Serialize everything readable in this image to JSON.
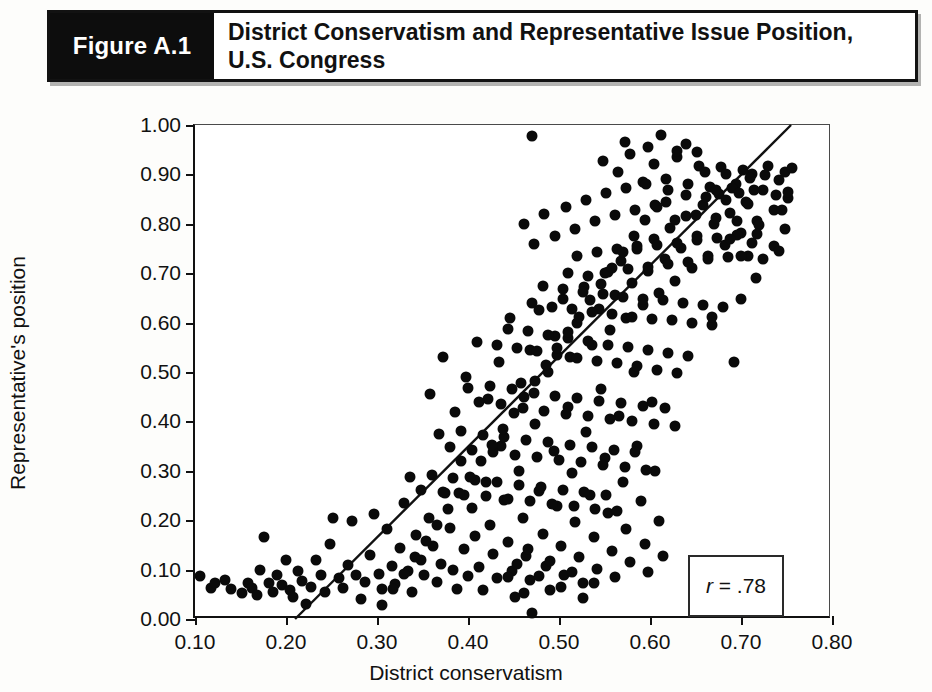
{
  "figure": {
    "number_label": "Figure A.1",
    "caption_line1": "District Conservatism and Representative Issue Position,",
    "caption_line2": "U.S. Congress"
  },
  "colors": {
    "point": "#0a0a0a",
    "axis": "#111111",
    "caption_bar_bg": "#0d0d0d",
    "caption_text": "#111111",
    "background": "#ffffff"
  },
  "annotation": {
    "symbol": "r",
    "equals": " = .78",
    "full": "r = .78"
  },
  "chart_data": {
    "type": "scatter",
    "title": "District Conservatism and Representative Issue Position, U.S. Congress",
    "xlabel": "District conservatism",
    "ylabel": "Representative's position",
    "xlim": [
      0.1,
      0.8
    ],
    "ylim": [
      0.0,
      1.0
    ],
    "xticks": [
      0.1,
      0.2,
      0.3,
      0.4,
      0.5,
      0.6,
      0.7,
      0.8
    ],
    "xtick_labels": [
      "0.10",
      "0.20",
      "0.30",
      "0.40",
      "0.50",
      "0.60",
      "0.70",
      "0.80"
    ],
    "yticks": [
      0.0,
      0.1,
      0.2,
      0.3,
      0.4,
      0.5,
      0.6,
      0.7,
      0.8,
      0.9,
      1.0
    ],
    "ytick_labels": [
      "0.00",
      "0.10",
      "0.20",
      "0.30",
      "0.40",
      "0.50",
      "0.60",
      "0.70",
      "0.80",
      "0.90",
      "1.00"
    ],
    "grid": false,
    "legend": false,
    "correlation": 0.78,
    "annotations": [
      "r = .78"
    ],
    "trendline": {
      "type": "linear",
      "x": [
        0.21,
        0.755
      ],
      "y": [
        0.0,
        1.0
      ]
    },
    "n_points": 380,
    "points": [
      [
        0.105,
        0.088
      ],
      [
        0.118,
        0.063
      ],
      [
        0.122,
        0.072
      ],
      [
        0.133,
        0.078
      ],
      [
        0.14,
        0.06
      ],
      [
        0.152,
        0.052
      ],
      [
        0.158,
        0.072
      ],
      [
        0.163,
        0.062
      ],
      [
        0.168,
        0.048
      ],
      [
        0.171,
        0.1
      ],
      [
        0.176,
        0.165
      ],
      [
        0.181,
        0.073
      ],
      [
        0.186,
        0.055
      ],
      [
        0.19,
        0.09
      ],
      [
        0.196,
        0.068
      ],
      [
        0.2,
        0.12
      ],
      [
        0.204,
        0.058
      ],
      [
        0.208,
        0.045
      ],
      [
        0.213,
        0.098
      ],
      [
        0.218,
        0.076
      ],
      [
        0.222,
        0.03
      ],
      [
        0.228,
        0.064
      ],
      [
        0.233,
        0.12
      ],
      [
        0.238,
        0.09
      ],
      [
        0.243,
        0.055
      ],
      [
        0.248,
        0.152
      ],
      [
        0.252,
        0.205
      ],
      [
        0.258,
        0.083
      ],
      [
        0.263,
        0.062
      ],
      [
        0.268,
        0.11
      ],
      [
        0.272,
        0.198
      ],
      [
        0.277,
        0.09
      ],
      [
        0.282,
        0.04
      ],
      [
        0.287,
        0.075
      ],
      [
        0.292,
        0.13
      ],
      [
        0.297,
        0.212
      ],
      [
        0.302,
        0.092
      ],
      [
        0.306,
        0.06
      ],
      [
        0.311,
        0.182
      ],
      [
        0.316,
        0.108
      ],
      [
        0.32,
        0.07
      ],
      [
        0.325,
        0.143
      ],
      [
        0.33,
        0.235
      ],
      [
        0.334,
        0.098
      ],
      [
        0.338,
        0.055
      ],
      [
        0.343,
        0.17
      ],
      [
        0.348,
        0.12
      ],
      [
        0.352,
        0.09
      ],
      [
        0.357,
        0.205
      ],
      [
        0.362,
        0.148
      ],
      [
        0.366,
        0.075
      ],
      [
        0.37,
        0.112
      ],
      [
        0.375,
        0.255
      ],
      [
        0.38,
        0.185
      ],
      [
        0.384,
        0.1
      ],
      [
        0.388,
        0.06
      ],
      [
        0.392,
        0.32
      ],
      [
        0.396,
        0.142
      ],
      [
        0.4,
        0.088
      ],
      [
        0.404,
        0.225
      ],
      [
        0.408,
        0.168
      ],
      [
        0.412,
        0.105
      ],
      [
        0.416,
        0.058
      ],
      [
        0.42,
        0.278
      ],
      [
        0.424,
        0.19
      ],
      [
        0.428,
        0.132
      ],
      [
        0.432,
        0.082
      ],
      [
        0.436,
        0.35
      ],
      [
        0.44,
        0.24
      ],
      [
        0.444,
        0.155
      ],
      [
        0.448,
        0.098
      ],
      [
        0.452,
        0.045
      ],
      [
        0.456,
        0.3
      ],
      [
        0.46,
        0.205
      ],
      [
        0.464,
        0.128
      ],
      [
        0.468,
        0.078
      ],
      [
        0.47,
        0.012
      ],
      [
        0.474,
        0.395
      ],
      [
        0.478,
        0.26
      ],
      [
        0.482,
        0.172
      ],
      [
        0.486,
        0.108
      ],
      [
        0.49,
        0.058
      ],
      [
        0.494,
        0.34
      ],
      [
        0.498,
        0.228
      ],
      [
        0.502,
        0.148
      ],
      [
        0.506,
        0.09
      ],
      [
        0.51,
        0.43
      ],
      [
        0.514,
        0.295
      ],
      [
        0.518,
        0.196
      ],
      [
        0.522,
        0.125
      ],
      [
        0.526,
        0.072
      ],
      [
        0.53,
        0.378
      ],
      [
        0.534,
        0.252
      ],
      [
        0.538,
        0.165
      ],
      [
        0.542,
        0.102
      ],
      [
        0.546,
        0.465
      ],
      [
        0.55,
        0.325
      ],
      [
        0.554,
        0.215
      ],
      [
        0.558,
        0.138
      ],
      [
        0.562,
        0.085
      ],
      [
        0.566,
        0.41
      ],
      [
        0.57,
        0.278
      ],
      [
        0.574,
        0.182
      ],
      [
        0.578,
        0.115
      ],
      [
        0.582,
        0.5
      ],
      [
        0.586,
        0.35
      ],
      [
        0.59,
        0.238
      ],
      [
        0.594,
        0.152
      ],
      [
        0.598,
        0.095
      ],
      [
        0.602,
        0.44
      ],
      [
        0.606,
        0.3
      ],
      [
        0.61,
        0.198
      ],
      [
        0.614,
        0.128
      ],
      [
        0.358,
        0.455
      ],
      [
        0.372,
        0.53
      ],
      [
        0.386,
        0.42
      ],
      [
        0.398,
        0.49
      ],
      [
        0.41,
        0.56
      ],
      [
        0.422,
        0.445
      ],
      [
        0.434,
        0.52
      ],
      [
        0.446,
        0.61
      ],
      [
        0.458,
        0.478
      ],
      [
        0.468,
        0.545
      ],
      [
        0.478,
        0.625
      ],
      [
        0.488,
        0.5
      ],
      [
        0.496,
        0.572
      ],
      [
        0.504,
        0.648
      ],
      [
        0.512,
        0.53
      ],
      [
        0.52,
        0.6
      ],
      [
        0.528,
        0.672
      ],
      [
        0.536,
        0.555
      ],
      [
        0.544,
        0.628
      ],
      [
        0.55,
        0.7
      ],
      [
        0.556,
        0.585
      ],
      [
        0.562,
        0.655
      ],
      [
        0.568,
        0.725
      ],
      [
        0.574,
        0.61
      ],
      [
        0.58,
        0.68
      ],
      [
        0.586,
        0.748
      ],
      [
        0.592,
        0.635
      ],
      [
        0.598,
        0.705
      ],
      [
        0.604,
        0.77
      ],
      [
        0.61,
        0.66
      ],
      [
        0.616,
        0.728
      ],
      [
        0.622,
        0.792
      ],
      [
        0.628,
        0.685
      ],
      [
        0.634,
        0.752
      ],
      [
        0.64,
        0.815
      ],
      [
        0.646,
        0.71
      ],
      [
        0.652,
        0.775
      ],
      [
        0.658,
        0.838
      ],
      [
        0.664,
        0.735
      ],
      [
        0.67,
        0.8
      ],
      [
        0.676,
        0.86
      ],
      [
        0.682,
        0.758
      ],
      [
        0.688,
        0.822
      ],
      [
        0.694,
        0.88
      ],
      [
        0.7,
        0.782
      ],
      [
        0.706,
        0.845
      ],
      [
        0.712,
        0.9
      ],
      [
        0.718,
        0.805
      ],
      [
        0.724,
        0.868
      ],
      [
        0.73,
        0.918
      ],
      [
        0.736,
        0.828
      ],
      [
        0.742,
        0.888
      ],
      [
        0.748,
        0.905
      ],
      [
        0.752,
        0.852
      ],
      [
        0.756,
        0.912
      ],
      [
        0.47,
        0.978
      ],
      [
        0.612,
        0.98
      ],
      [
        0.548,
        0.928
      ],
      [
        0.565,
        0.905
      ],
      [
        0.578,
        0.942
      ],
      [
        0.592,
        0.885
      ],
      [
        0.604,
        0.922
      ],
      [
        0.618,
        0.89
      ],
      [
        0.63,
        0.935
      ],
      [
        0.642,
        0.88
      ],
      [
        0.654,
        0.918
      ],
      [
        0.666,
        0.875
      ],
      [
        0.678,
        0.915
      ],
      [
        0.69,
        0.872
      ],
      [
        0.702,
        0.908
      ],
      [
        0.714,
        0.868
      ],
      [
        0.726,
        0.898
      ],
      [
        0.738,
        0.858
      ],
      [
        0.462,
        0.8
      ],
      [
        0.472,
        0.76
      ],
      [
        0.484,
        0.82
      ],
      [
        0.496,
        0.775
      ],
      [
        0.508,
        0.835
      ],
      [
        0.518,
        0.79
      ],
      [
        0.53,
        0.848
      ],
      [
        0.54,
        0.805
      ],
      [
        0.552,
        0.862
      ],
      [
        0.562,
        0.818
      ],
      [
        0.574,
        0.872
      ],
      [
        0.584,
        0.828
      ],
      [
        0.596,
        0.88
      ],
      [
        0.606,
        0.838
      ],
      [
        0.618,
        0.845
      ],
      [
        0.628,
        0.808
      ],
      [
        0.64,
        0.858
      ],
      [
        0.65,
        0.818
      ],
      [
        0.662,
        0.855
      ],
      [
        0.672,
        0.812
      ],
      [
        0.684,
        0.848
      ],
      [
        0.696,
        0.805
      ],
      [
        0.708,
        0.84
      ],
      [
        0.72,
        0.798
      ],
      [
        0.51,
        0.7
      ],
      [
        0.52,
        0.735
      ],
      [
        0.532,
        0.695
      ],
      [
        0.542,
        0.742
      ],
      [
        0.554,
        0.702
      ],
      [
        0.564,
        0.748
      ],
      [
        0.576,
        0.708
      ],
      [
        0.586,
        0.755
      ],
      [
        0.598,
        0.712
      ],
      [
        0.608,
        0.758
      ],
      [
        0.62,
        0.718
      ],
      [
        0.63,
        0.762
      ],
      [
        0.642,
        0.722
      ],
      [
        0.652,
        0.768
      ],
      [
        0.664,
        0.728
      ],
      [
        0.674,
        0.772
      ],
      [
        0.686,
        0.732
      ],
      [
        0.696,
        0.778
      ],
      [
        0.708,
        0.735
      ],
      [
        0.718,
        0.78
      ],
      [
        0.47,
        0.64
      ],
      [
        0.482,
        0.675
      ],
      [
        0.492,
        0.632
      ],
      [
        0.504,
        0.668
      ],
      [
        0.514,
        0.628
      ],
      [
        0.526,
        0.662
      ],
      [
        0.536,
        0.622
      ],
      [
        0.548,
        0.658
      ],
      [
        0.558,
        0.618
      ],
      [
        0.57,
        0.652
      ],
      [
        0.58,
        0.612
      ],
      [
        0.592,
        0.648
      ],
      [
        0.602,
        0.608
      ],
      [
        0.614,
        0.645
      ],
      [
        0.624,
        0.605
      ],
      [
        0.636,
        0.64
      ],
      [
        0.646,
        0.6
      ],
      [
        0.658,
        0.636
      ],
      [
        0.668,
        0.596
      ],
      [
        0.68,
        0.632
      ],
      [
        0.432,
        0.555
      ],
      [
        0.444,
        0.588
      ],
      [
        0.454,
        0.548
      ],
      [
        0.466,
        0.582
      ],
      [
        0.476,
        0.542
      ],
      [
        0.488,
        0.575
      ],
      [
        0.498,
        0.535
      ],
      [
        0.51,
        0.568
      ],
      [
        0.52,
        0.528
      ],
      [
        0.532,
        0.562
      ],
      [
        0.542,
        0.522
      ],
      [
        0.554,
        0.555
      ],
      [
        0.564,
        0.518
      ],
      [
        0.576,
        0.55
      ],
      [
        0.586,
        0.512
      ],
      [
        0.598,
        0.545
      ],
      [
        0.608,
        0.505
      ],
      [
        0.62,
        0.538
      ],
      [
        0.63,
        0.498
      ],
      [
        0.642,
        0.532
      ],
      [
        0.4,
        0.468
      ],
      [
        0.412,
        0.44
      ],
      [
        0.424,
        0.472
      ],
      [
        0.436,
        0.435
      ],
      [
        0.448,
        0.465
      ],
      [
        0.46,
        0.428
      ],
      [
        0.472,
        0.458
      ],
      [
        0.484,
        0.422
      ],
      [
        0.496,
        0.452
      ],
      [
        0.508,
        0.415
      ],
      [
        0.52,
        0.448
      ],
      [
        0.532,
        0.41
      ],
      [
        0.544,
        0.442
      ],
      [
        0.556,
        0.405
      ],
      [
        0.568,
        0.438
      ],
      [
        0.58,
        0.4
      ],
      [
        0.592,
        0.432
      ],
      [
        0.604,
        0.395
      ],
      [
        0.616,
        0.428
      ],
      [
        0.628,
        0.39
      ],
      [
        0.368,
        0.375
      ],
      [
        0.38,
        0.348
      ],
      [
        0.392,
        0.38
      ],
      [
        0.404,
        0.342
      ],
      [
        0.416,
        0.372
      ],
      [
        0.428,
        0.338
      ],
      [
        0.44,
        0.368
      ],
      [
        0.452,
        0.332
      ],
      [
        0.464,
        0.362
      ],
      [
        0.476,
        0.328
      ],
      [
        0.488,
        0.358
      ],
      [
        0.5,
        0.322
      ],
      [
        0.512,
        0.352
      ],
      [
        0.524,
        0.318
      ],
      [
        0.536,
        0.348
      ],
      [
        0.548,
        0.312
      ],
      [
        0.56,
        0.342
      ],
      [
        0.572,
        0.308
      ],
      [
        0.584,
        0.338
      ],
      [
        0.596,
        0.302
      ],
      [
        0.336,
        0.288
      ],
      [
        0.348,
        0.262
      ],
      [
        0.36,
        0.292
      ],
      [
        0.372,
        0.258
      ],
      [
        0.384,
        0.285
      ],
      [
        0.396,
        0.252
      ],
      [
        0.408,
        0.282
      ],
      [
        0.42,
        0.248
      ],
      [
        0.432,
        0.278
      ],
      [
        0.444,
        0.242
      ],
      [
        0.456,
        0.272
      ],
      [
        0.468,
        0.238
      ],
      [
        0.48,
        0.268
      ],
      [
        0.492,
        0.232
      ],
      [
        0.504,
        0.262
      ],
      [
        0.516,
        0.228
      ],
      [
        0.528,
        0.258
      ],
      [
        0.54,
        0.222
      ],
      [
        0.552,
        0.252
      ],
      [
        0.564,
        0.218
      ],
      [
        0.66,
        0.905
      ],
      [
        0.672,
        0.868
      ],
      [
        0.684,
        0.9
      ],
      [
        0.698,
        0.862
      ],
      [
        0.71,
        0.892
      ],
      [
        0.688,
        0.77
      ],
      [
        0.7,
        0.735
      ],
      [
        0.712,
        0.762
      ],
      [
        0.724,
        0.728
      ],
      [
        0.736,
        0.755
      ],
      [
        0.692,
        0.52
      ],
      [
        0.668,
        0.612
      ],
      [
        0.7,
        0.648
      ],
      [
        0.716,
        0.69
      ],
      [
        0.745,
        0.828
      ],
      [
        0.752,
        0.865
      ],
      [
        0.748,
        0.79
      ],
      [
        0.742,
        0.745
      ],
      [
        0.64,
        0.962
      ],
      [
        0.598,
        0.955
      ],
      [
        0.572,
        0.965
      ],
      [
        0.63,
        0.948
      ],
      [
        0.652,
        0.945
      ],
      [
        0.62,
        0.868
      ],
      [
        0.608,
        0.835
      ],
      [
        0.594,
        0.808
      ],
      [
        0.582,
        0.775
      ],
      [
        0.57,
        0.742
      ],
      [
        0.558,
        0.71
      ],
      [
        0.546,
        0.678
      ],
      [
        0.534,
        0.645
      ],
      [
        0.522,
        0.612
      ],
      [
        0.51,
        0.58
      ],
      [
        0.498,
        0.548
      ],
      [
        0.486,
        0.515
      ],
      [
        0.474,
        0.482
      ],
      [
        0.462,
        0.45
      ],
      [
        0.45,
        0.418
      ],
      [
        0.438,
        0.385
      ],
      [
        0.426,
        0.352
      ],
      [
        0.414,
        0.32
      ],
      [
        0.402,
        0.288
      ],
      [
        0.39,
        0.255
      ],
      [
        0.378,
        0.222
      ],
      [
        0.366,
        0.19
      ],
      [
        0.354,
        0.158
      ],
      [
        0.342,
        0.125
      ],
      [
        0.33,
        0.092
      ],
      [
        0.318,
        0.06
      ],
      [
        0.306,
        0.028
      ],
      [
        0.454,
        0.112
      ],
      [
        0.466,
        0.142
      ],
      [
        0.478,
        0.088
      ],
      [
        0.49,
        0.118
      ],
      [
        0.502,
        0.065
      ],
      [
        0.514,
        0.095
      ],
      [
        0.526,
        0.042
      ],
      [
        0.538,
        0.072
      ],
      [
        0.462,
        0.052
      ],
      [
        0.444,
        0.085
      ]
    ]
  }
}
